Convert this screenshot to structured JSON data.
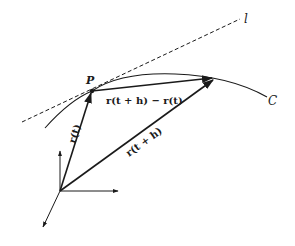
{
  "diagram": {
    "labels": {
      "point": "P",
      "tangent_line": "l",
      "curve": "C",
      "position_vector": "r(t)",
      "position_vector_h": "r(t + h)",
      "difference_vector": "r(t + h) − r(t)"
    },
    "colors": {
      "stroke": "#1a1a1a",
      "background": "#ffffff"
    }
  }
}
